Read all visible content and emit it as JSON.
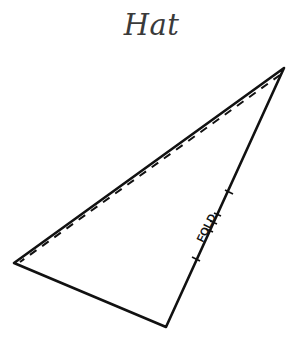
{
  "title": "Hat",
  "pattern": {
    "shape": "triangle",
    "vertices": {
      "top_right": [
        284,
        68
      ],
      "left": [
        14,
        263
      ],
      "bottom": [
        166,
        327
      ]
    },
    "fold_label": "FOLD",
    "edges": {
      "outer": "solid",
      "seam_allowance": "dashed",
      "fold": "solid-with-ticks"
    },
    "stroke_color": "#111111"
  }
}
